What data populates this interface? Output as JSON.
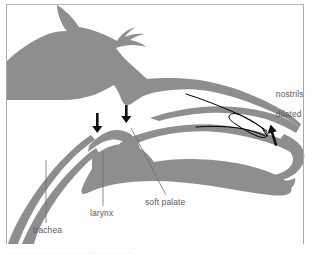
{
  "figure": {
    "background_color": "#ffffff",
    "silhouette_color": "#8e8e8e",
    "outline_color": "#000000",
    "label_color": "#5a5a5a",
    "frame_color": "#a9a9a9"
  },
  "labels": {
    "trachea": "trachea",
    "larynx": "larynx",
    "soft_palate": "soft palate",
    "nostrils_line1": "nostrils",
    "nostrils_line2": "dilated"
  },
  "annotations": {
    "arrow_larynx": "down-arrow",
    "arrow_soft_palate": "down-arrow",
    "arrow_nostril": "up-arrow",
    "nasal_tube": "tube-outline",
    "nostril_opening": "white-dot"
  },
  "caption": {
    "clipped_line": "................................................................"
  }
}
